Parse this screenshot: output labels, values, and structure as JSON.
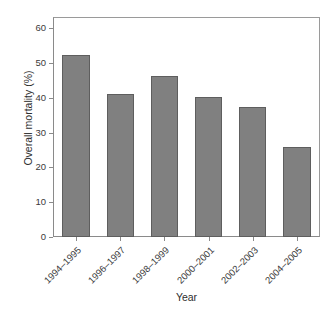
{
  "chart_data": {
    "type": "bar",
    "title": "",
    "subtitle": "",
    "xlabel": "Year",
    "ylabel": "Overall mortality (%)",
    "categories": [
      "1994–1995",
      "1996–1997",
      "1998–1999",
      "2000–2001",
      "2002–2003",
      "2004–2005"
    ],
    "values": [
      52.5,
      41.0,
      46.3,
      40.2,
      37.5,
      25.8
    ],
    "ylim": [
      0,
      63
    ],
    "yticks": [
      0,
      10,
      20,
      30,
      40,
      50,
      60
    ],
    "ytick_labels": [
      "0",
      "10",
      "20",
      "30",
      "40",
      "50",
      "60"
    ],
    "xlim": [
      0,
      6
    ],
    "grid": false,
    "legend": null,
    "annotations": [],
    "bar_color": "#808080",
    "bar_edge_color": "#5e5e5e",
    "frame_color": "#8a8a8a",
    "text_color": "#3a3a3a",
    "background": "#ffffff"
  }
}
